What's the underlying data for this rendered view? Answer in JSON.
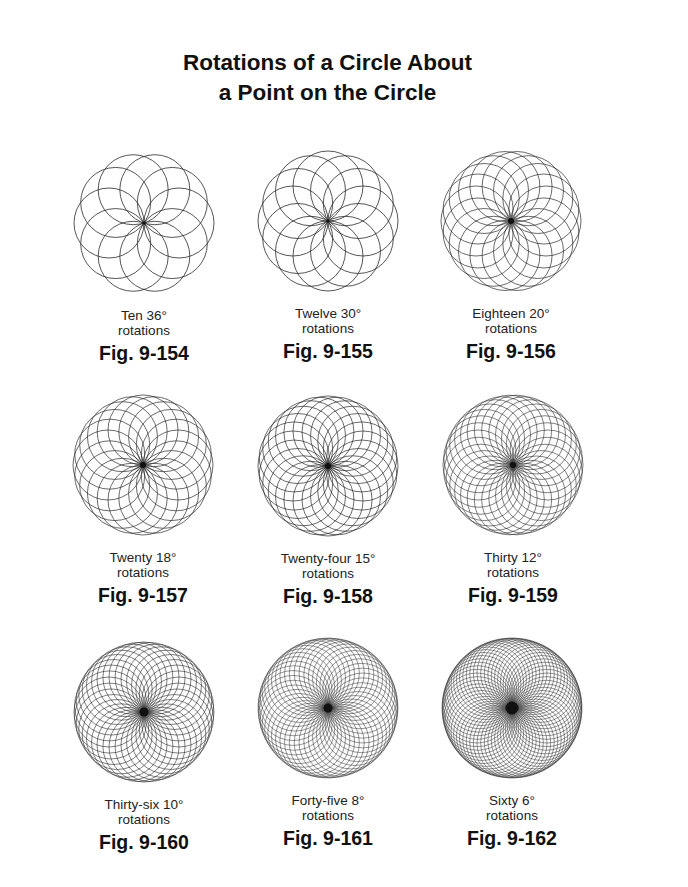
{
  "title": {
    "line1": "Rotations of a Circle About",
    "line2": "a Point on the Circle"
  },
  "figures": [
    {
      "caption_line1": "Ten 36°",
      "caption_line2": "rotations",
      "label": "Fig. 9-154",
      "rotations": 10,
      "angle_deg": 36,
      "cx": 144,
      "cy": 223
    },
    {
      "caption_line1": "Twelve 30°",
      "caption_line2": "rotations",
      "label": "Fig. 9-155",
      "rotations": 12,
      "angle_deg": 30,
      "cx": 328,
      "cy": 221
    },
    {
      "caption_line1": "Eighteen 20°",
      "caption_line2": "rotations",
      "label": "Fig. 9-156",
      "rotations": 18,
      "angle_deg": 20,
      "cx": 511,
      "cy": 221
    },
    {
      "caption_line1": "Twenty 18°",
      "caption_line2": "rotations",
      "label": "Fig. 9-157",
      "rotations": 20,
      "angle_deg": 18,
      "cx": 143,
      "cy": 465
    },
    {
      "caption_line1": "Twenty-four 15°",
      "caption_line2": "rotations",
      "label": "Fig. 9-158",
      "rotations": 24,
      "angle_deg": 15,
      "cx": 328,
      "cy": 466
    },
    {
      "caption_line1": "Thirty 12°",
      "caption_line2": "rotations",
      "label": "Fig. 9-159",
      "rotations": 30,
      "angle_deg": 12,
      "cx": 513,
      "cy": 465
    },
    {
      "caption_line1": "Thirty-six 10°",
      "caption_line2": "rotations",
      "label": "Fig. 9-160",
      "rotations": 36,
      "angle_deg": 10,
      "cx": 144,
      "cy": 712
    },
    {
      "caption_line1": "Forty-five 8°",
      "caption_line2": "rotations",
      "label": "Fig. 9-161",
      "rotations": 45,
      "angle_deg": 8,
      "cx": 328,
      "cy": 708
    },
    {
      "caption_line1": "Sixty 6°",
      "caption_line2": "rotations",
      "label": "Fig. 9-162",
      "rotations": 60,
      "angle_deg": 6,
      "cx": 512,
      "cy": 708
    }
  ],
  "style": {
    "stroke_color": "#2a2a2a",
    "outer_radius": 70
  }
}
